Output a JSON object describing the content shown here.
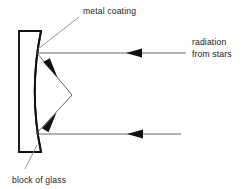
{
  "diagram": {
    "canvas": {
      "width": 247,
      "height": 189,
      "background": "#ffffff"
    },
    "colors": {
      "outline": "#111111",
      "ray": "#555555",
      "arrowhead": "#111111",
      "leader": "#777777",
      "text": "#1a1a1a",
      "background": "#ffffff"
    },
    "labels": {
      "metal_coating": "metal coating",
      "block_of_glass": "block of glass",
      "radiation_line1": "radiation",
      "radiation_line2": "from stars"
    },
    "components": {
      "glass_block": {
        "name": "block of glass",
        "left_edge_x": 19,
        "right_edge_x": 41,
        "top_y": 31,
        "bottom_y": 152,
        "arc_apex_x": 30,
        "arc_apex_y": 92
      },
      "mirror_surface": {
        "name": "metal coating",
        "shape": "concave arc",
        "top_point": [
          41,
          31
        ],
        "apex_point": [
          30,
          92
        ],
        "bottom_point": [
          41,
          152
        ]
      },
      "focus_point": {
        "x": 72,
        "y": 95
      }
    },
    "rays": [
      {
        "name": "incoming-ray-upper",
        "from": [
          186,
          53
        ],
        "to": [
          37,
          53
        ],
        "arrow_at": [
          130,
          53
        ],
        "direction": "left"
      },
      {
        "name": "incoming-ray-lower",
        "from": [
          181,
          134
        ],
        "to": [
          36,
          134
        ],
        "arrow_at": [
          131,
          134
        ],
        "direction": "left"
      },
      {
        "name": "reflected-ray-upper",
        "from": [
          37,
          53
        ],
        "to": [
          72,
          95
        ],
        "arrow_at": [
          54,
          73
        ],
        "direction": "down-right"
      },
      {
        "name": "reflected-ray-lower",
        "from": [
          36,
          134
        ],
        "to": [
          72,
          95
        ],
        "arrow_at": [
          53,
          116
        ],
        "direction": "up-right"
      }
    ],
    "leaders": [
      {
        "name": "metal-coating-leader",
        "from": [
          38,
          49
        ],
        "to": [
          79,
          17
        ]
      },
      {
        "name": "block-of-glass-leader",
        "from": [
          37,
          145
        ],
        "to": [
          25,
          169
        ]
      }
    ],
    "label_positions": {
      "metal_coating": {
        "x": 83,
        "y": 14
      },
      "block_of_glass": {
        "x": 12,
        "y": 183
      },
      "radiation": {
        "x": 192,
        "y": 45
      },
      "from_stars": {
        "x": 192,
        "y": 57
      }
    }
  }
}
